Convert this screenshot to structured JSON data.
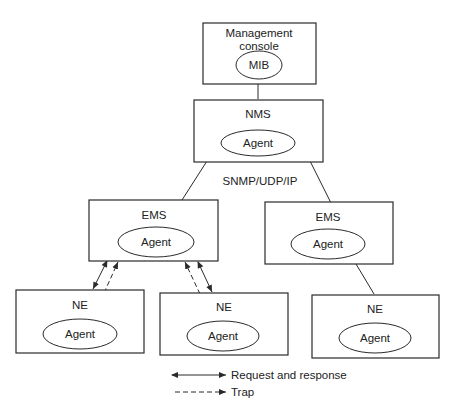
{
  "diagram": {
    "nodes": {
      "console": {
        "title": "Management console",
        "title_line1": "Management",
        "title_line2": "console",
        "inner": "MIB"
      },
      "nms": {
        "title": "NMS",
        "inner": "Agent"
      },
      "ems_left": {
        "title": "EMS",
        "inner": "Agent"
      },
      "ems_right": {
        "title": "EMS",
        "inner": "Agent"
      },
      "ne_left": {
        "title": "NE",
        "inner": "Agent"
      },
      "ne_middle": {
        "title": "NE",
        "inner": "Agent"
      },
      "ne_right": {
        "title": "NE",
        "inner": "Agent"
      }
    },
    "protocol_label": "SNMP/UDP/IP",
    "edges": [
      {
        "from": "console",
        "to": "nms",
        "style": "solid"
      },
      {
        "from": "nms",
        "to": "ems_left",
        "style": "solid"
      },
      {
        "from": "nms",
        "to": "ems_right",
        "style": "solid"
      },
      {
        "from": "ems_left",
        "to": "ne_left",
        "style": "request-response + trap"
      },
      {
        "from": "ems_left",
        "to": "ne_middle",
        "style": "request-response + trap"
      },
      {
        "from": "ems_right",
        "to": "ne_right",
        "style": "solid"
      }
    ],
    "legend": {
      "request_response": "Request and response",
      "trap": "Trap"
    }
  }
}
